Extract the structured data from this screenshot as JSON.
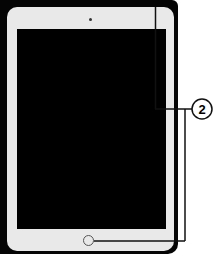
{
  "diagram": {
    "callouts": [
      {
        "number": "2",
        "targets": [
          "top-button",
          "home-button"
        ]
      }
    ],
    "colors": {
      "frame": "#050505",
      "bezel": "#e9e9e9",
      "screen": "#000000",
      "line": "#111111"
    }
  }
}
